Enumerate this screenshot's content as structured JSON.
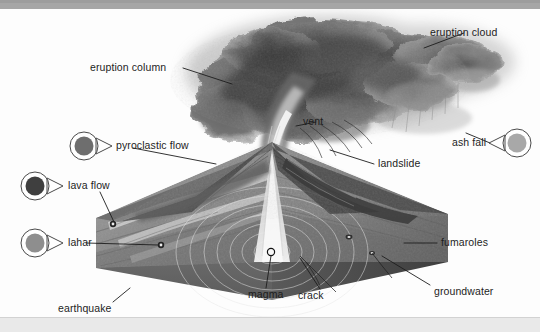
{
  "figure": {
    "type": "diagram",
    "background_color": "#fdfdfd",
    "top_bar_color": "#a6a6a6",
    "bottom_bar_color": "#e9e9e9",
    "text_color": "#1d1d1d"
  },
  "labels": {
    "eruption_cloud": "eruption cloud",
    "eruption_column": "eruption column",
    "vent": "vent",
    "landslide": "landslide",
    "fumaroles": "fumaroles",
    "groundwater": "groundwater",
    "crack": "crack",
    "magma": "magma",
    "earthquake": "earthquake"
  },
  "markers": [
    {
      "id": "pyroclastic-flow",
      "label": "pyroclastic flow",
      "fill": "#6e6e6e",
      "direction": "right"
    },
    {
      "id": "lava-flow",
      "label": "lava flow",
      "fill": "#3f3f3f",
      "direction": "right"
    },
    {
      "id": "lahar",
      "label": "lahar",
      "fill": "#8e8e8e",
      "direction": "right"
    },
    {
      "id": "ash-fall",
      "label": "ash fall",
      "fill": "#a8a8a8",
      "direction": "left"
    }
  ],
  "palette": {
    "cloud_dark": "#4a4a4a",
    "cloud_mid": "#6d6d6d",
    "cloud_light": "#9b9b9b",
    "block_front": "#6a6a6a",
    "block_side": "#4e4e4e",
    "block_top": "#8b8b8b",
    "cross_section": "#8f8f8f",
    "leader_line": "#1d1d1d"
  }
}
